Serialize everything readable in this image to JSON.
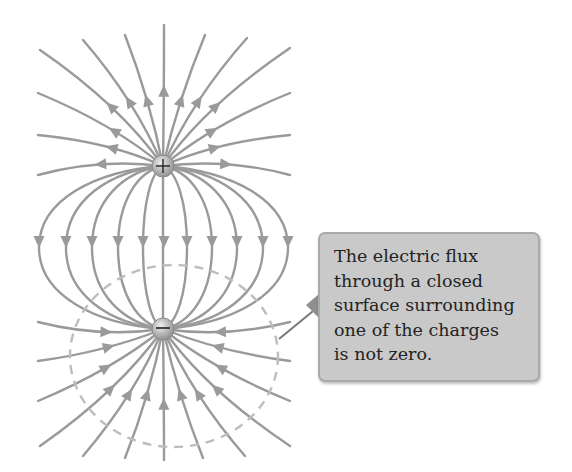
{
  "diagram": {
    "charges": [
      {
        "id": "positive",
        "sign": "+",
        "label": "+",
        "cx": 163,
        "cy": 166,
        "r": 11
      },
      {
        "id": "negative",
        "sign": "-",
        "label": "−",
        "cx": 163,
        "cy": 329,
        "r": 11
      }
    ],
    "colors": {
      "field_line": "#9a9a9a",
      "arrow": "#9a9a9a",
      "charge_fill": "#b5b5b5",
      "charge_highlight": "#e6e6e6",
      "charge_symbol": "#222222",
      "gaussian_surface": "#bdbdbd",
      "callout_bg": "#c9c9c9",
      "callout_border": "#a9a9a9",
      "leader": "#777777"
    },
    "gaussian_surface": {
      "style": "dashed",
      "cx": 174,
      "cy": 356,
      "rx": 104,
      "ry": 91,
      "encloses": "negative"
    },
    "connecting_lines_count": 11,
    "outgoing_lines_count": 12,
    "incoming_lines_count": 12
  },
  "callout": {
    "lines": [
      "The electric flux",
      "through a closed",
      "surface surrounding",
      "one of the charges",
      "is not zero."
    ]
  }
}
